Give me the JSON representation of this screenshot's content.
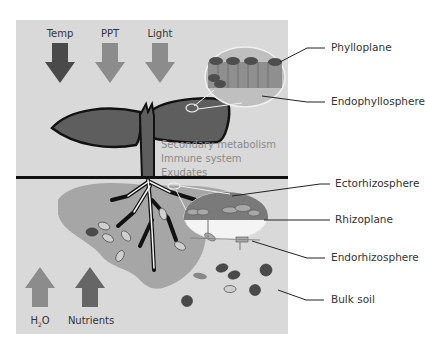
{
  "diagram": {
    "environmental_factors_above": [
      {
        "label": "Temp",
        "color": "#4a4a4a",
        "direction": "down"
      },
      {
        "label": "PPT",
        "color": "#8c8c8c",
        "direction": "down"
      },
      {
        "label": "Light",
        "color": "#8c8c8c",
        "direction": "down"
      }
    ],
    "environmental_factors_below": [
      {
        "label": "H",
        "sub": "2",
        "label_tail": "O",
        "color": "#8c8c8c",
        "direction": "up"
      },
      {
        "label": "Nutrients",
        "color": "#666666",
        "direction": "up"
      }
    ],
    "plant_functions": [
      "Secondary metabolism",
      "Immune system",
      "Exudates"
    ],
    "compartments": [
      {
        "label": "Phylloplane"
      },
      {
        "label": "Endophyllosphere"
      },
      {
        "label": "Ectorhizosphere"
      },
      {
        "label": "Rhizoplane"
      },
      {
        "label": "Endorhizosphere"
      },
      {
        "label": "Bulk soil"
      }
    ],
    "colors": {
      "background_panel": "#d9d9d9",
      "plant": "#5e5e5e",
      "rhizosphere": "#a6a6a6",
      "soil_line": "#111111"
    }
  }
}
